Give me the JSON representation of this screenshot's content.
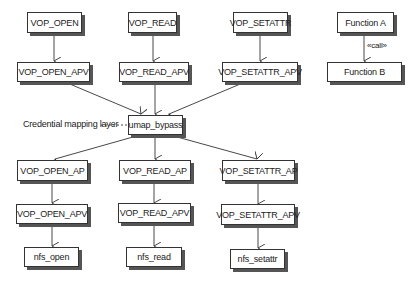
{
  "diagram": {
    "top_row": [
      {
        "id": "vop_open",
        "label": "VOP_OPEN"
      },
      {
        "id": "vop_read",
        "label": "VOP_READ"
      },
      {
        "id": "vop_setattr",
        "label": "VOP_SETATTR"
      }
    ],
    "apv_row_top": [
      {
        "id": "vop_open_apv_1",
        "label": "VOP_OPEN_APV"
      },
      {
        "id": "vop_read_apv_1",
        "label": "VOP_READ_APV"
      },
      {
        "id": "vop_setattr_apv_1",
        "label": "VOP_SETATTR_APV"
      }
    ],
    "center": {
      "label": "umap_bypass"
    },
    "annotation": {
      "label": "Credential mapping layer"
    },
    "ap_row": [
      {
        "id": "vop_open_ap",
        "label": "VOP_OPEN_AP"
      },
      {
        "id": "vop_read_ap",
        "label": "VOP_READ_AP"
      },
      {
        "id": "vop_setattr_ap",
        "label": "VOP_SETATTR_AP"
      }
    ],
    "apv_row_bottom": [
      {
        "id": "vop_open_apv_2",
        "label": "VOP_OPEN_APV"
      },
      {
        "id": "vop_read_apv_2",
        "label": "VOP_READ_APV"
      },
      {
        "id": "vop_setattr_apv_2",
        "label": "VOP_SETATTR_APV"
      }
    ],
    "nfs_row": [
      {
        "id": "nfs_open",
        "label": "nfs_open"
      },
      {
        "id": "nfs_read",
        "label": "nfs_read"
      },
      {
        "id": "nfs_setattr",
        "label": "nfs_setattr"
      }
    ],
    "legend": {
      "caller": "Function A",
      "callee": "Function B",
      "edge_label": "«call»"
    }
  }
}
